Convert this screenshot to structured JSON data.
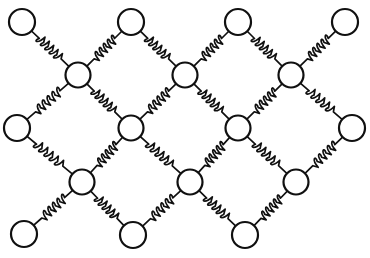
{
  "figure": {
    "background_color": "#ffffff",
    "stroke_color": "#101010",
    "mass_fill_color": "#ffffff",
    "canvas": {
      "width": 370,
      "height": 258
    }
  },
  "style": {
    "spring_stroke_width": 1.7,
    "mass_stroke_width": 2.2,
    "coil_count": 5,
    "coil_amplitude": 4.2
  },
  "lattice": {
    "rows": 5,
    "type": "diamond",
    "boundary_mass_radius": 13,
    "interior_mass_radius": 12.5,
    "nodes": [
      {
        "id": "n-a1",
        "row": 0,
        "col": 0,
        "x": 22,
        "y": 22,
        "r": 13,
        "kind": "boundary"
      },
      {
        "id": "n-a2",
        "row": 0,
        "col": 1,
        "x": 131,
        "y": 22,
        "r": 13,
        "kind": "boundary"
      },
      {
        "id": "n-a3",
        "row": 0,
        "col": 2,
        "x": 238,
        "y": 22,
        "r": 13,
        "kind": "boundary"
      },
      {
        "id": "n-a4",
        "row": 0,
        "col": 3,
        "x": 345,
        "y": 22,
        "r": 13,
        "kind": "boundary"
      },
      {
        "id": "n-b1",
        "row": 1,
        "col": 0,
        "x": 78,
        "y": 75,
        "r": 12.5,
        "kind": "interior"
      },
      {
        "id": "n-b2",
        "row": 1,
        "col": 1,
        "x": 185,
        "y": 75,
        "r": 12.5,
        "kind": "interior"
      },
      {
        "id": "n-b3",
        "row": 1,
        "col": 2,
        "x": 291,
        "y": 75,
        "r": 12.5,
        "kind": "interior"
      },
      {
        "id": "n-c1",
        "row": 2,
        "col": 0,
        "x": 17,
        "y": 128,
        "r": 13,
        "kind": "boundary"
      },
      {
        "id": "n-c2",
        "row": 2,
        "col": 1,
        "x": 131,
        "y": 128,
        "r": 12.5,
        "kind": "interior"
      },
      {
        "id": "n-c3",
        "row": 2,
        "col": 2,
        "x": 238,
        "y": 128,
        "r": 12.5,
        "kind": "interior"
      },
      {
        "id": "n-c4",
        "row": 2,
        "col": 3,
        "x": 352,
        "y": 128,
        "r": 13,
        "kind": "boundary"
      },
      {
        "id": "n-d1",
        "row": 3,
        "col": 0,
        "x": 82,
        "y": 182,
        "r": 12.5,
        "kind": "interior"
      },
      {
        "id": "n-d2",
        "row": 3,
        "col": 1,
        "x": 190,
        "y": 182,
        "r": 12.5,
        "kind": "interior"
      },
      {
        "id": "n-d3",
        "row": 3,
        "col": 2,
        "x": 296,
        "y": 182,
        "r": 12.5,
        "kind": "interior"
      },
      {
        "id": "n-e1",
        "row": 4,
        "col": 0,
        "x": 24,
        "y": 234,
        "r": 13,
        "kind": "boundary"
      },
      {
        "id": "n-e2",
        "row": 4,
        "col": 1,
        "x": 133,
        "y": 235,
        "r": 13,
        "kind": "boundary"
      },
      {
        "id": "n-e3",
        "row": 4,
        "col": 2,
        "x": 245,
        "y": 235,
        "r": 13,
        "kind": "boundary"
      }
    ],
    "springs": [
      {
        "id": "s-01",
        "from": "n-a1",
        "to": "n-b1"
      },
      {
        "id": "s-02",
        "from": "n-a2",
        "to": "n-b1"
      },
      {
        "id": "s-03",
        "from": "n-a2",
        "to": "n-b2"
      },
      {
        "id": "s-04",
        "from": "n-a3",
        "to": "n-b2"
      },
      {
        "id": "s-05",
        "from": "n-a3",
        "to": "n-b3"
      },
      {
        "id": "s-06",
        "from": "n-a4",
        "to": "n-b3"
      },
      {
        "id": "s-07",
        "from": "n-b1",
        "to": "n-c1"
      },
      {
        "id": "s-08",
        "from": "n-b1",
        "to": "n-c2"
      },
      {
        "id": "s-09",
        "from": "n-b2",
        "to": "n-c2"
      },
      {
        "id": "s-10",
        "from": "n-b2",
        "to": "n-c3"
      },
      {
        "id": "s-11",
        "from": "n-b3",
        "to": "n-c3"
      },
      {
        "id": "s-12",
        "from": "n-b3",
        "to": "n-c4"
      },
      {
        "id": "s-13",
        "from": "n-c1",
        "to": "n-d1"
      },
      {
        "id": "s-14",
        "from": "n-c2",
        "to": "n-d1"
      },
      {
        "id": "s-15",
        "from": "n-c2",
        "to": "n-d2"
      },
      {
        "id": "s-16",
        "from": "n-c3",
        "to": "n-d2"
      },
      {
        "id": "s-17",
        "from": "n-c3",
        "to": "n-d3"
      },
      {
        "id": "s-18",
        "from": "n-c4",
        "to": "n-d3"
      },
      {
        "id": "s-19",
        "from": "n-d1",
        "to": "n-e1"
      },
      {
        "id": "s-20",
        "from": "n-d1",
        "to": "n-e2"
      },
      {
        "id": "s-21",
        "from": "n-d2",
        "to": "n-e2"
      },
      {
        "id": "s-22",
        "from": "n-d2",
        "to": "n-e3"
      },
      {
        "id": "s-23",
        "from": "n-d3",
        "to": "n-e3"
      }
    ]
  }
}
